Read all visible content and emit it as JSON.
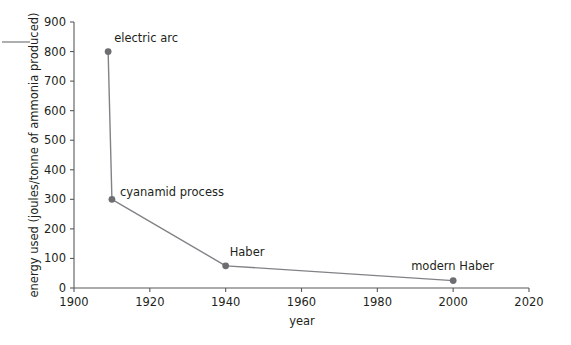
{
  "chart_data": {
    "type": "line",
    "title": "",
    "subtitle": "",
    "xlabel": "year",
    "ylabel": "energy used (joules/tonne of ammonia produced)",
    "xlim": [
      1900,
      2020
    ],
    "ylim": [
      0,
      900
    ],
    "xticks": [
      1900,
      1920,
      1940,
      1960,
      1980,
      2000,
      2020
    ],
    "xtick_labels": [
      "1900",
      "1920",
      "1940",
      "1960",
      "1980",
      "2000",
      "2020"
    ],
    "yticks": [
      0,
      100,
      200,
      300,
      400,
      500,
      600,
      700,
      800,
      900
    ],
    "ytick_labels": [
      "0",
      "100",
      "200",
      "300",
      "400",
      "500",
      "600",
      "700",
      "800",
      "900"
    ],
    "grid": false,
    "legend": "none",
    "marker": "circle",
    "line_color": "#808285",
    "marker_color": "#6d6e71",
    "axis_color": "#58595b",
    "x": [
      1909,
      1910,
      1940,
      2000
    ],
    "values": [
      800,
      300,
      75,
      25
    ],
    "series": [
      {
        "name": "energy used",
        "x": [
          1909,
          1910,
          1940,
          2000
        ],
        "values": [
          800,
          300,
          75,
          25
        ]
      }
    ],
    "annotations": [
      {
        "text": "electric arc",
        "x": 1909,
        "y": 800,
        "dx": 6,
        "dy": -10
      },
      {
        "text": "cyanamid process",
        "x": 1910,
        "y": 300,
        "dx": 8,
        "dy": -3
      },
      {
        "text": "Haber",
        "x": 1940,
        "y": 75,
        "dx": 4,
        "dy": -10
      },
      {
        "text": "modern Haber",
        "x": 2000,
        "y": 25,
        "dx": -42,
        "dy": -11
      }
    ],
    "decorations": [
      {
        "name": "corner-dash",
        "x1": 2,
        "y1": 42,
        "x2": 30,
        "y2": 42
      }
    ]
  }
}
